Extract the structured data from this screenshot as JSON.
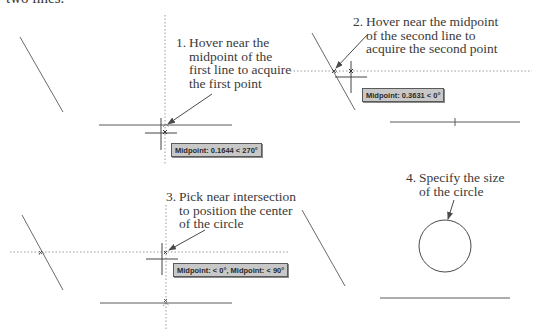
{
  "header": {
    "cut_off_text": "two lines."
  },
  "steps": [
    {
      "number": "1.",
      "lines": [
        "Hover near the",
        "midpoint of the",
        "first line to acquire",
        "the first point"
      ],
      "tooltip": "Midpoint: 0.1644 < 270°"
    },
    {
      "number": "2.",
      "lines": [
        "Hover near the midpoint",
        "of the second line to",
        "acquire the second point"
      ],
      "tooltip": "Midpoint: 0.3631 < 0°"
    },
    {
      "number": "3.",
      "lines": [
        "Pick near intersection",
        "to position the center",
        "of the circle"
      ],
      "tooltip": "Midpoint: < 0°,  Midpoint: < 90°"
    },
    {
      "number": "4.",
      "lines": [
        "Specify the size",
        "of the circle"
      ],
      "tooltip": null
    }
  ],
  "colors": {
    "line": "#5a5a5a",
    "tracking": "#8c8c8c",
    "tooltip_bg": "#c8c8c8",
    "tooltip_border": "#5a5a5a",
    "text": "#3a3a3a"
  }
}
